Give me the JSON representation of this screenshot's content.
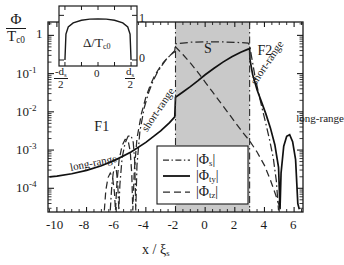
{
  "figure": {
    "ylabel_num": "Φ",
    "ylabel_den": "T",
    "ylabel_den_sub": "c0",
    "xlabel_main": "x / ",
    "xlabel_sym": "ξ",
    "xlabel_sub": "s",
    "xticks": [
      "-10",
      "-8",
      "-6",
      "-4",
      "-2",
      "0",
      "2",
      "4",
      "6"
    ],
    "xtick_values": [
      -10,
      -8,
      -6,
      -4,
      -2,
      0,
      2,
      4,
      6
    ],
    "ytick_labels": [
      "1",
      "10",
      "10",
      "10",
      "10"
    ],
    "ytick_exponents": [
      "",
      "-1",
      "-2",
      "-3",
      "-4"
    ],
    "ytick_values": [
      0,
      -1,
      -2,
      -3,
      -4
    ],
    "region_labels": [
      {
        "text": "F1",
        "x": -7.0,
        "y": -2.45
      },
      {
        "text": "S",
        "x": 0.4,
        "y": -0.42
      },
      {
        "text": "F2",
        "x": 4.0,
        "y": -0.45
      }
    ],
    "annotations": [
      {
        "text": "long-range",
        "x": -9.1,
        "y": -3.32,
        "rot": -11
      },
      {
        "text": "short-range",
        "x": -4.15,
        "y": -2.35,
        "rot": -56
      },
      {
        "text": "short-range",
        "x": 3.25,
        "y": -1.12,
        "rot": -56
      },
      {
        "text": "long-range",
        "x": 6.15,
        "y": -2.02,
        "rot": 0
      }
    ],
    "shaded_region": {
      "x0": -2.0,
      "x1": 3.0,
      "color": "#c9c9c9",
      "label": "S"
    }
  },
  "inset": {
    "ylabel": "Δ/T",
    "ylabel_sub": "c0",
    "xticks": [
      {
        "num": "-d",
        "num_sub": "s",
        "den": "2"
      },
      {
        "num": "0",
        "num_sub": "",
        "den": ""
      },
      {
        "num": "d",
        "num_sub": "s",
        "den": "2"
      }
    ],
    "yticks": [
      "1",
      "0"
    ]
  },
  "legend": {
    "entries": [
      {
        "label": "|Φ",
        "sub": "s",
        "label_end": "|",
        "style": "dash-dot"
      },
      {
        "label": "|Φ",
        "sub": "ty",
        "label_end": "|",
        "style": "solid"
      },
      {
        "label": "|Φ",
        "sub": "tz",
        "label_end": "|",
        "style": "dashed"
      }
    ]
  },
  "chart_data": {
    "type": "line",
    "title": "",
    "xlabel": "x / ξ_s",
    "ylabel": "Φ / T_c0",
    "yscale": "log10",
    "xlim": [
      -10.6,
      6.6
    ],
    "ylim": [
      -4.62,
      0.35
    ],
    "grid": false,
    "legend_position": "bottom-center",
    "series": [
      {
        "name": "|Φ_ty|",
        "style": "solid",
        "comment": "long-range triplet component; smooth monotone decay in F1, peak at S edges, oscillating decay in F2",
        "points": [
          [
            -10.5,
            -3.7
          ],
          [
            -10.0,
            -3.68
          ],
          [
            -9.0,
            -3.62
          ],
          [
            -8.0,
            -3.53
          ],
          [
            -7.0,
            -3.41
          ],
          [
            -6.0,
            -3.25
          ],
          [
            -5.0,
            -3.05
          ],
          [
            -4.0,
            -2.8
          ],
          [
            -3.0,
            -2.5
          ],
          [
            -2.4,
            -2.28
          ],
          [
            -2.05,
            -2.13
          ],
          [
            -2.0,
            -1.62
          ],
          [
            -1.5,
            -1.48
          ],
          [
            -1.0,
            -1.34
          ],
          [
            -0.5,
            -1.19
          ],
          [
            0.0,
            -1.03
          ],
          [
            0.6,
            -0.86
          ],
          [
            1.2,
            -0.7
          ],
          [
            1.8,
            -0.56
          ],
          [
            2.4,
            -0.44
          ],
          [
            2.9,
            -0.36
          ],
          [
            3.0,
            -0.34
          ],
          [
            3.02,
            -0.62
          ],
          [
            3.2,
            -1.02
          ],
          [
            3.5,
            -1.42
          ],
          [
            3.8,
            -1.74
          ],
          [
            4.1,
            -2.06
          ],
          [
            4.4,
            -2.42
          ],
          [
            4.7,
            -2.86
          ],
          [
            4.95,
            -3.45
          ],
          [
            5.05,
            -4.55
          ],
          [
            5.12,
            -3.6
          ],
          [
            5.3,
            -2.9
          ],
          [
            5.5,
            -2.64
          ],
          [
            5.7,
            -2.6
          ],
          [
            5.9,
            -2.78
          ],
          [
            6.1,
            -3.25
          ],
          [
            6.25,
            -4.4
          ],
          [
            6.35,
            -4.55
          ]
        ]
      },
      {
        "name": "|Φ_s|",
        "style": "dash-dot",
        "comment": "singlet component; strongly oscillating short-range decay with log-scale zeros",
        "points": [
          [
            -6.4,
            -4.58
          ],
          [
            -6.3,
            -3.95
          ],
          [
            -6.2,
            -3.6
          ],
          [
            -6.1,
            -3.45
          ],
          [
            -6.0,
            -3.5
          ],
          [
            -5.9,
            -3.85
          ],
          [
            -5.82,
            -4.58
          ],
          [
            -5.75,
            -3.9
          ],
          [
            -5.6,
            -3.2
          ],
          [
            -5.4,
            -2.82
          ],
          [
            -5.2,
            -2.64
          ],
          [
            -5.0,
            -2.62
          ],
          [
            -4.85,
            -2.8
          ],
          [
            -4.75,
            -3.3
          ],
          [
            -4.68,
            -4.58
          ],
          [
            -4.6,
            -3.4
          ],
          [
            -4.4,
            -2.5
          ],
          [
            -4.1,
            -1.88
          ],
          [
            -3.8,
            -1.48
          ],
          [
            -3.5,
            -1.18
          ],
          [
            -3.2,
            -0.95
          ],
          [
            -2.9,
            -0.78
          ],
          [
            -2.6,
            -0.62
          ],
          [
            -2.3,
            -0.5
          ],
          [
            -2.05,
            -0.4
          ],
          [
            -2.0,
            -0.22
          ],
          [
            -1.0,
            -0.18
          ],
          [
            0.0,
            -0.17
          ],
          [
            1.0,
            -0.17
          ],
          [
            2.0,
            -0.18
          ],
          [
            2.9,
            -0.2
          ],
          [
            3.0,
            -0.26
          ],
          [
            3.15,
            -0.6
          ],
          [
            3.35,
            -1.05
          ],
          [
            3.6,
            -1.5
          ],
          [
            3.85,
            -1.92
          ],
          [
            4.1,
            -2.32
          ],
          [
            4.35,
            -2.74
          ],
          [
            4.6,
            -3.22
          ],
          [
            4.8,
            -3.8
          ],
          [
            4.95,
            -4.58
          ]
        ]
      },
      {
        "name": "|Φ_tz|",
        "style": "dashed",
        "comment": "short-range triplet component; oscillating decay in F1, monotone decay across S and F2",
        "points": [
          [
            -6.8,
            -4.58
          ],
          [
            -6.7,
            -4.05
          ],
          [
            -6.55,
            -3.72
          ],
          [
            -6.4,
            -3.6
          ],
          [
            -6.25,
            -3.7
          ],
          [
            -6.12,
            -4.1
          ],
          [
            -6.05,
            -4.58
          ],
          [
            -5.95,
            -3.85
          ],
          [
            -5.8,
            -3.25
          ],
          [
            -5.6,
            -2.88
          ],
          [
            -5.4,
            -2.72
          ],
          [
            -5.2,
            -2.74
          ],
          [
            -5.05,
            -3.05
          ],
          [
            -4.95,
            -3.62
          ],
          [
            -4.88,
            -4.58
          ],
          [
            -4.78,
            -3.55
          ],
          [
            -4.6,
            -2.7
          ],
          [
            -4.3,
            -2.05
          ],
          [
            -4.0,
            -1.62
          ],
          [
            -3.7,
            -1.3
          ],
          [
            -3.4,
            -1.05
          ],
          [
            -3.1,
            -0.86
          ],
          [
            -2.8,
            -0.7
          ],
          [
            -2.5,
            -0.57
          ],
          [
            -2.2,
            -0.47
          ],
          [
            -2.05,
            -0.43
          ],
          [
            -2.0,
            -0.3
          ],
          [
            -1.5,
            -0.5
          ],
          [
            -1.0,
            -0.72
          ],
          [
            -0.5,
            -0.96
          ],
          [
            0.0,
            -1.22
          ],
          [
            0.5,
            -1.48
          ],
          [
            1.0,
            -1.74
          ],
          [
            1.5,
            -2.0
          ],
          [
            2.0,
            -2.26
          ],
          [
            2.5,
            -2.52
          ],
          [
            3.0,
            -2.76
          ],
          [
            3.5,
            -3.05
          ],
          [
            4.0,
            -3.4
          ],
          [
            4.4,
            -3.78
          ],
          [
            4.8,
            -4.22
          ],
          [
            5.1,
            -4.58
          ]
        ]
      }
    ],
    "inset_chart": {
      "type": "line",
      "comment": "superconducting gap profile Δ/T_c0 across the S layer",
      "xlabel": "x",
      "ylabel": "Δ/T_c0",
      "xticks": [
        "-d_s/2",
        "0",
        "d_s/2"
      ],
      "yticks": [
        "0",
        "1"
      ],
      "x": [
        -1.0,
        -0.97,
        -0.9,
        -0.75,
        -0.5,
        -0.25,
        0.0,
        0.25,
        0.5,
        0.75,
        0.9,
        0.97,
        1.0
      ],
      "y": [
        0.0,
        0.58,
        0.74,
        0.83,
        0.89,
        0.915,
        0.92,
        0.915,
        0.89,
        0.83,
        0.74,
        0.58,
        0.0
      ]
    }
  }
}
